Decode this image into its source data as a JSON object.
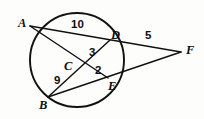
{
  "figure": {
    "type": "circle-geometry-diagram",
    "background_color": "#fdfdfc",
    "stroke_color": "#111111",
    "circle": {
      "cx": 77,
      "cy": 60,
      "r": 47
    },
    "points": [
      {
        "id": "A",
        "label": "A",
        "x": 30,
        "y": 26,
        "label_x": 18,
        "label_y": 17,
        "on_circle": true
      },
      {
        "id": "B",
        "label": "B",
        "x": 48,
        "y": 97,
        "label_x": 39,
        "label_y": 99,
        "on_circle": true
      },
      {
        "id": "C",
        "label": "C",
        "x": 84,
        "y": 66,
        "label_x": 64,
        "label_y": 60,
        "on_circle": false
      },
      {
        "id": "D",
        "label": "D",
        "x": 110,
        "y": 40,
        "label_x": 111,
        "label_y": 29,
        "on_circle": true
      },
      {
        "id": "E",
        "label": "E",
        "x": 108,
        "y": 78,
        "label_x": 108,
        "label_y": 80,
        "on_circle": true
      },
      {
        "id": "F",
        "label": "F",
        "x": 181,
        "y": 52,
        "label_x": 186,
        "label_y": 44,
        "on_circle": false
      }
    ],
    "segments": [
      {
        "id": "A-F",
        "from": "A",
        "to": "F",
        "through": [
          "D"
        ],
        "description": "secant from A through D to F"
      },
      {
        "id": "B-F",
        "from": "B",
        "to": "F",
        "through": [
          "E"
        ],
        "description": "secant from B through E to F"
      },
      {
        "id": "A-E",
        "from": "A",
        "to": "E",
        "through": [
          "C"
        ],
        "description": "chord A to E crossing at C"
      },
      {
        "id": "B-D",
        "from": "B",
        "to": "D",
        "through": [
          "C"
        ],
        "description": "chord B to D crossing at C"
      }
    ],
    "measures": [
      {
        "id": "AD",
        "value": "10",
        "segment": "A to D",
        "x": 71,
        "y": 19
      },
      {
        "id": "DF",
        "value": "5",
        "segment": "D to F",
        "x": 145,
        "y": 30
      },
      {
        "id": "CD",
        "value": "3",
        "segment": "C to D",
        "x": 89,
        "y": 47
      },
      {
        "id": "CE",
        "value": "2",
        "segment": "C to E",
        "x": 95,
        "y": 65
      },
      {
        "id": "BC",
        "value": "9",
        "segment": "B to C",
        "x": 54,
        "y": 75
      }
    ]
  }
}
